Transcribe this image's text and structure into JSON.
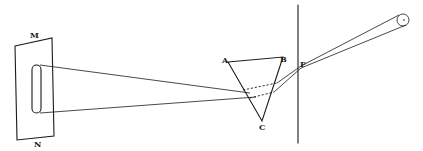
{
  "diagram": {
    "labels": {
      "screen_top": "M",
      "screen_bottom": "N",
      "prism_vertex_a": "A",
      "prism_vertex_b": "B",
      "prism_vertex_c": "C",
      "aperture_point": "F"
    },
    "elements": [
      {
        "id": "light-source",
        "shape": "circle",
        "cx": 403,
        "cy": 20,
        "r": 6
      },
      {
        "id": "aperture-line",
        "shape": "line",
        "x1": 298,
        "y1": 5,
        "x2": 298,
        "y2": 143
      },
      {
        "id": "prism",
        "shape": "triangle",
        "points": [
          [
            228,
            62
          ],
          [
            283,
            57
          ],
          [
            262,
            121
          ]
        ]
      },
      {
        "id": "screen",
        "shape": "parallelogram",
        "points": [
          [
            15,
            46
          ],
          [
            52,
            38
          ],
          [
            54,
            136
          ],
          [
            17,
            140
          ]
        ]
      },
      {
        "id": "spectrum-slot",
        "shape": "rounded-rect",
        "x": 32,
        "y": 65,
        "width": 9,
        "height": 48
      }
    ],
    "colors": {
      "ink": "#1a1a1a",
      "background": "#ffffff"
    }
  }
}
